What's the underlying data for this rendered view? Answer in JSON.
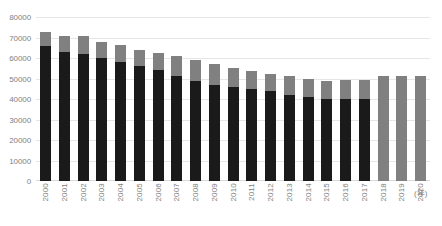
{
  "chart_data": {
    "type": "bar",
    "subtype": "stacked-vertical",
    "title": "",
    "xlabel": "(年)",
    "ylabel": "",
    "ylim": [
      0,
      80000
    ],
    "ytick_step": 10000,
    "yticks": [
      "80000",
      "70000",
      "60000",
      "50000",
      "40000",
      "30000",
      "20000",
      "10000",
      "0"
    ],
    "grid": true,
    "legend": "none",
    "categories": [
      "2000",
      "2001",
      "2002",
      "2003",
      "2004",
      "2005",
      "2006",
      "2007",
      "2008",
      "2009",
      "2010",
      "2011",
      "2012",
      "2013",
      "2014",
      "2015",
      "2016",
      "2017",
      "2018",
      "2019",
      "2020"
    ],
    "colors": {
      "lower": "#1a1a1a",
      "upper": "#808080",
      "gridline": "#e6e6e6",
      "text": "#7f7f7f",
      "background": "#ffffff"
    },
    "series": [
      {
        "name": "lower-segment",
        "color": "#1a1a1a",
        "values": [
          66000,
          63000,
          62000,
          60000,
          58000,
          56000,
          54000,
          51000,
          49000,
          47000,
          46000,
          45000,
          44000,
          42000,
          41000,
          40000,
          40000,
          40000,
          0,
          0,
          0
        ]
      },
      {
        "name": "upper-segment",
        "color": "#808080",
        "values": [
          6500,
          7500,
          8500,
          8000,
          8500,
          8000,
          8500,
          10000,
          10000,
          10000,
          9000,
          8500,
          8000,
          9000,
          9000,
          9000,
          9500,
          9500,
          51000,
          51000,
          51000
        ]
      }
    ],
    "totals": [
      72500,
      70500,
      70500,
      68000,
      66500,
      64000,
      62500,
      61000,
      59000,
      57000,
      55000,
      53500,
      52000,
      51000,
      50000,
      49000,
      49500,
      49500,
      51000,
      51000,
      51000
    ]
  }
}
